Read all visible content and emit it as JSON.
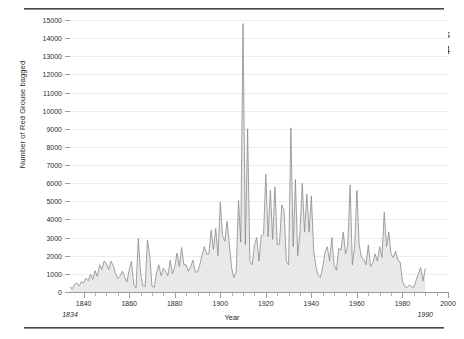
{
  "title": {
    "line1": "Drumlanrig Grouse Records",
    "line2": "since 1834"
  },
  "axes": {
    "ylabel": "Number of Red Grouse bagged",
    "xlabel": "Year",
    "yticks": [
      0,
      1000,
      2000,
      3000,
      4000,
      5000,
      6000,
      7000,
      8000,
      9000,
      10000,
      11000,
      12000,
      13000,
      14000,
      15000
    ],
    "xticks": [
      1840,
      1860,
      1880,
      1900,
      1920,
      1940,
      1960,
      1980,
      2000
    ]
  },
  "annotations": {
    "start_year": "1834",
    "end_year": "1990"
  },
  "colors": {
    "fill": "#e9e9e9",
    "line": "#8a8a8a",
    "grid": "#ececec",
    "axis": "#9a9a9a",
    "text": "#2d2d2d"
  },
  "chart_data": {
    "type": "area",
    "title": "Drumlanrig Grouse Records since 1834",
    "xlabel": "Year",
    "ylabel": "Number of Red Grouse bagged",
    "xlim": [
      1834,
      2000
    ],
    "ylim": [
      0,
      15000
    ],
    "grid": true,
    "legend": "none",
    "x": [
      1834,
      1835,
      1836,
      1837,
      1838,
      1839,
      1840,
      1841,
      1842,
      1843,
      1844,
      1845,
      1846,
      1847,
      1848,
      1849,
      1850,
      1851,
      1852,
      1853,
      1854,
      1855,
      1856,
      1857,
      1858,
      1859,
      1860,
      1861,
      1862,
      1863,
      1864,
      1865,
      1866,
      1867,
      1868,
      1869,
      1870,
      1871,
      1872,
      1873,
      1874,
      1875,
      1876,
      1877,
      1878,
      1879,
      1880,
      1881,
      1882,
      1883,
      1884,
      1885,
      1886,
      1887,
      1888,
      1889,
      1890,
      1891,
      1892,
      1893,
      1894,
      1895,
      1896,
      1897,
      1898,
      1899,
      1900,
      1901,
      1902,
      1903,
      1904,
      1905,
      1906,
      1907,
      1908,
      1909,
      1910,
      1911,
      1912,
      1913,
      1914,
      1915,
      1916,
      1917,
      1918,
      1919,
      1920,
      1921,
      1922,
      1923,
      1924,
      1925,
      1926,
      1927,
      1928,
      1929,
      1930,
      1931,
      1932,
      1933,
      1934,
      1935,
      1936,
      1937,
      1938,
      1939,
      1940,
      1941,
      1942,
      1943,
      1944,
      1945,
      1946,
      1947,
      1948,
      1949,
      1950,
      1951,
      1952,
      1953,
      1954,
      1955,
      1956,
      1957,
      1958,
      1959,
      1960,
      1961,
      1962,
      1963,
      1964,
      1965,
      1966,
      1967,
      1968,
      1969,
      1970,
      1971,
      1972,
      1973,
      1974,
      1975,
      1976,
      1977,
      1978,
      1979,
      1980,
      1981,
      1982,
      1983,
      1984,
      1985,
      1986,
      1987,
      1988,
      1989,
      1990
    ],
    "values": [
      280,
      180,
      420,
      500,
      330,
      560,
      500,
      760,
      620,
      980,
      700,
      1180,
      860,
      1500,
      1250,
      1700,
      1550,
      1250,
      1700,
      1450,
      1000,
      760,
      880,
      1150,
      820,
      560,
      1220,
      1700,
      400,
      220,
      2950,
      1050,
      350,
      300,
      2850,
      2050,
      330,
      260,
      1050,
      1500,
      900,
      1300,
      1150,
      900,
      1750,
      1000,
      1400,
      2150,
      1400,
      2450,
      1500,
      1500,
      1150,
      1400,
      1750,
      1100,
      1100,
      1500,
      2050,
      2500,
      2100,
      2100,
      3400,
      2350,
      3500,
      2000,
      4950,
      3100,
      2800,
      3900,
      2600,
      1300,
      800,
      1100,
      5050,
      2750,
      14800,
      2600,
      9000,
      1700,
      1500,
      2600,
      3000,
      1700,
      3100,
      3200,
      6500,
      3050,
      5600,
      2900,
      5800,
      2600,
      2650,
      4800,
      4500,
      1700,
      1500,
      9050,
      2500,
      6200,
      2000,
      3300,
      6000,
      3300,
      5400,
      3300,
      5300,
      2300,
      1400,
      900,
      800,
      1400,
      2200,
      2500,
      1700,
      3000,
      1500,
      1200,
      2400,
      2300,
      3300,
      2100,
      2600,
      5900,
      1500,
      2500,
      5600,
      2600,
      1900,
      1800,
      1500,
      2600,
      1400,
      1600,
      2100,
      1700,
      2500,
      1900,
      4400,
      2500,
      3300,
      2100,
      1900,
      2250,
      1750,
      1650,
      600,
      300,
      250,
      400,
      300,
      250,
      650,
      1000,
      1350,
      600,
      1300
    ],
    "peaks": [
      {
        "year": 1913,
        "value": 14800
      },
      {
        "year": 1915,
        "value": 9000
      },
      {
        "year": 1931,
        "value": 9050
      },
      {
        "year": 1923,
        "value": 6500
      },
      {
        "year": 1934,
        "value": 6200
      },
      {
        "year": 1956,
        "value": 5900
      }
    ]
  }
}
